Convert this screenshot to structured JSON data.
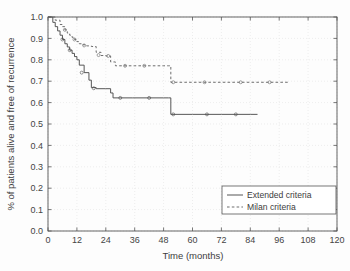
{
  "chart_data": {
    "type": "line",
    "title": "",
    "xlabel": "Time (months)",
    "ylabel": "% of patients alive and free of recurrence",
    "xlim": [
      0,
      120
    ],
    "ylim": [
      0.0,
      1.0
    ],
    "xticks": [
      0,
      12,
      24,
      36,
      48,
      60,
      72,
      84,
      96,
      108,
      120
    ],
    "xtick_labels": [
      "0",
      "12",
      "24",
      "36",
      "48",
      "60",
      "72",
      "84",
      "96",
      "108",
      "120"
    ],
    "yticks": [
      0.0,
      0.1,
      0.2,
      0.3,
      0.4,
      0.5,
      0.6,
      0.7,
      0.8,
      0.9,
      1.0
    ],
    "ytick_labels": [
      "0.0",
      "0.1",
      "0.2",
      "0.3",
      "0.4",
      "0.5",
      "0.6",
      "0.7",
      "0.8",
      "0.9",
      "1.0"
    ],
    "grid": true,
    "legend_position": "lower right",
    "step_type": "post",
    "series": [
      {
        "name": "Extended criteria",
        "linestyle": "solid",
        "color": "#4d4d4d",
        "x": [
          0,
          2,
          3,
          4,
          5,
          6,
          7,
          8,
          9,
          10,
          11,
          12,
          13,
          15,
          17,
          18,
          20,
          24,
          26,
          27,
          35,
          48,
          50,
          51,
          60,
          72,
          84,
          87
        ],
        "y": [
          1.0,
          0.975,
          0.955,
          0.935,
          0.915,
          0.895,
          0.875,
          0.86,
          0.845,
          0.83,
          0.815,
          0.8,
          0.775,
          0.74,
          0.705,
          0.67,
          0.665,
          0.665,
          0.645,
          0.622,
          0.622,
          0.622,
          0.622,
          0.545,
          0.545,
          0.545,
          0.545,
          0.545
        ]
      },
      {
        "name": "Milan criteria",
        "linestyle": "dashed",
        "color": "#666666",
        "x": [
          0,
          3,
          5,
          6,
          7,
          8,
          9,
          10,
          11,
          12,
          13,
          14,
          16,
          18,
          20,
          22,
          24,
          26,
          28,
          36,
          48,
          50,
          51,
          60,
          72,
          84,
          96,
          100
        ],
        "y": [
          1.0,
          0.985,
          0.965,
          0.955,
          0.94,
          0.925,
          0.915,
          0.905,
          0.895,
          0.885,
          0.875,
          0.87,
          0.865,
          0.862,
          0.835,
          0.82,
          0.818,
          0.79,
          0.772,
          0.772,
          0.772,
          0.772,
          0.695,
          0.695,
          0.695,
          0.695,
          0.695,
          0.695
        ]
      }
    ]
  },
  "legend": {
    "items": [
      {
        "label": "Extended criteria",
        "style": "solid"
      },
      {
        "label": "Milan criteria",
        "style": "dashed"
      }
    ]
  },
  "axes": {
    "x_title": "Time (months)",
    "y_title": "% of patients alive and free of recurrence"
  },
  "colors": {
    "background": "#fdfdfd",
    "axis": "#555555",
    "grid": "#e2e2e2",
    "extended": "#4d4d4d",
    "milan": "#666666",
    "text": "#3c3c3c"
  }
}
